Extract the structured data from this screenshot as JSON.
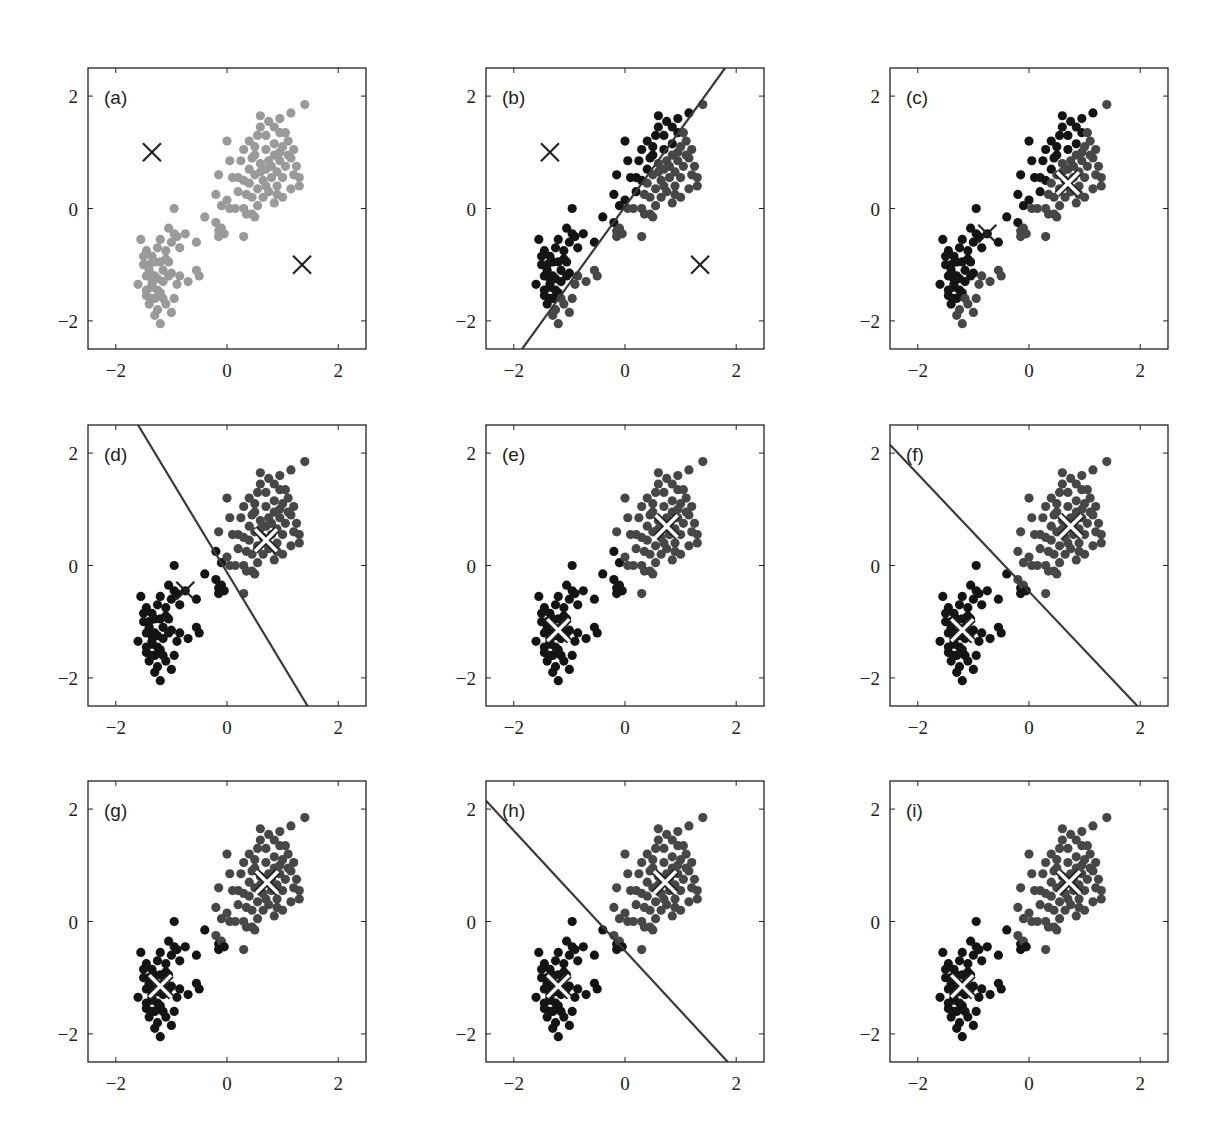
{
  "chart_data": {
    "type": "scatter",
    "xlim": [
      -2.5,
      2.5
    ],
    "ylim": [
      -2.5,
      2.5
    ],
    "xticks": [
      "−2",
      "0",
      "2"
    ],
    "yticks": [
      "2",
      "0",
      "−2"
    ],
    "grid": false,
    "legend": null,
    "colors": {
      "unassigned": "#9a9a9a",
      "cluster1": "#141414",
      "cluster2": "#474747",
      "line": "#3a3a3a",
      "axis": "#222222"
    },
    "panels": [
      {
        "label": "(a)",
        "state": "init",
        "centroids": [
          [
            -1.35,
            1.0
          ],
          [
            1.35,
            -1.0
          ]
        ],
        "centroid_style": "black",
        "line": null
      },
      {
        "label": "(b)",
        "state": "assign",
        "centroids": [
          [
            -1.35,
            1.0
          ],
          [
            1.35,
            -1.0
          ]
        ],
        "centroid_style": "black",
        "line": [
          [
            -1.85,
            -2.5
          ],
          [
            1.8,
            2.5
          ]
        ]
      },
      {
        "label": "(c)",
        "state": "update",
        "centroids": [
          [
            -0.75,
            -0.45
          ],
          [
            0.7,
            0.45
          ]
        ],
        "centroid_style": "mixed",
        "line": null
      },
      {
        "label": "(d)",
        "state": "assign",
        "centroids": [
          [
            -0.75,
            -0.45
          ],
          [
            0.7,
            0.45
          ]
        ],
        "centroid_style": "mixed",
        "line": [
          [
            -1.6,
            2.5
          ],
          [
            1.45,
            -2.5
          ]
        ]
      },
      {
        "label": "(e)",
        "state": "update",
        "centroids": [
          [
            -1.2,
            -1.15
          ],
          [
            0.75,
            0.7
          ]
        ],
        "centroid_style": "white",
        "line": null
      },
      {
        "label": "(f)",
        "state": "assign",
        "centroids": [
          [
            -1.2,
            -1.15
          ],
          [
            0.75,
            0.7
          ]
        ],
        "centroid_style": "white",
        "line": [
          [
            -2.5,
            2.15
          ],
          [
            1.95,
            -2.5
          ]
        ]
      },
      {
        "label": "(g)",
        "state": "update",
        "centroids": [
          [
            -1.2,
            -1.15
          ],
          [
            0.72,
            0.7
          ]
        ],
        "centroid_style": "white",
        "line": null
      },
      {
        "label": "(h)",
        "state": "assign",
        "centroids": [
          [
            -1.2,
            -1.15
          ],
          [
            0.72,
            0.7
          ]
        ],
        "centroid_style": "white",
        "line": [
          [
            -2.5,
            2.15
          ],
          [
            1.85,
            -2.5
          ]
        ]
      },
      {
        "label": "(i)",
        "state": "update",
        "centroids": [
          [
            -1.2,
            -1.15
          ],
          [
            0.72,
            0.7
          ]
        ],
        "centroid_style": "white",
        "line": null
      }
    ],
    "points": [
      [
        -1.55,
        -0.55
      ],
      [
        -1.45,
        -0.75
      ],
      [
        -1.5,
        -0.85
      ],
      [
        -1.6,
        -1.35
      ],
      [
        -1.45,
        -1.2
      ],
      [
        -1.4,
        -1.0
      ],
      [
        -1.35,
        -1.4
      ],
      [
        -1.3,
        -1.6
      ],
      [
        -1.25,
        -1.8
      ],
      [
        -1.2,
        -2.05
      ],
      [
        -1.3,
        -1.9
      ],
      [
        -1.4,
        -1.7
      ],
      [
        -1.45,
        -1.55
      ],
      [
        -1.35,
        -1.25
      ],
      [
        -1.3,
        -0.95
      ],
      [
        -1.25,
        -0.7
      ],
      [
        -1.2,
        -0.55
      ],
      [
        -1.1,
        -0.75
      ],
      [
        -1.05,
        -0.95
      ],
      [
        -1.0,
        -1.15
      ],
      [
        -1.15,
        -1.3
      ],
      [
        -1.2,
        -1.5
      ],
      [
        -1.1,
        -1.7
      ],
      [
        -1.0,
        -1.85
      ],
      [
        -0.95,
        -1.6
      ],
      [
        -0.9,
        -1.35
      ],
      [
        -0.85,
        -1.2
      ],
      [
        -1.0,
        -0.6
      ],
      [
        -0.95,
        -0.45
      ],
      [
        -0.9,
        -0.5
      ],
      [
        -0.85,
        -0.7
      ],
      [
        -1.05,
        -0.35
      ],
      [
        -0.75,
        -0.45
      ],
      [
        -0.7,
        -1.3
      ],
      [
        -0.55,
        -1.1
      ],
      [
        -0.5,
        -1.2
      ],
      [
        -1.5,
        -1.0
      ],
      [
        -1.4,
        -1.1
      ],
      [
        -1.35,
        -1.35
      ],
      [
        -1.25,
        -1.45
      ],
      [
        -1.15,
        -1.1
      ],
      [
        -1.05,
        -1.2
      ],
      [
        -1.3,
        -1.2
      ],
      [
        -1.2,
        -0.95
      ],
      [
        -1.1,
        -0.9
      ],
      [
        -1.45,
        -1.45
      ],
      [
        -1.35,
        -1.6
      ],
      [
        -1.15,
        -1.6
      ],
      [
        -1.25,
        -1.25
      ],
      [
        -1.35,
        -0.85
      ],
      [
        -0.95,
        0.0
      ],
      [
        -0.4,
        -0.15
      ],
      [
        -0.55,
        -0.6
      ],
      [
        -0.2,
        -0.25
      ],
      [
        -0.15,
        -0.4
      ],
      [
        -0.1,
        -0.35
      ],
      [
        -0.05,
        -0.45
      ],
      [
        -0.15,
        -0.5
      ],
      [
        0.3,
        -0.5
      ],
      [
        -0.1,
        0.05
      ],
      [
        -0.2,
        0.25
      ],
      [
        -0.15,
        0.6
      ],
      [
        0.0,
        1.2
      ],
      [
        0.05,
        0.85
      ],
      [
        0.1,
        0.55
      ],
      [
        0.0,
        0.15
      ],
      [
        0.05,
        0.0
      ],
      [
        0.15,
        0.0
      ],
      [
        0.3,
        0.0
      ],
      [
        0.35,
        -0.1
      ],
      [
        0.45,
        -0.1
      ],
      [
        0.5,
        -0.15
      ],
      [
        0.2,
        0.3
      ],
      [
        0.3,
        0.5
      ],
      [
        0.4,
        0.7
      ],
      [
        0.45,
        0.9
      ],
      [
        0.5,
        1.1
      ],
      [
        0.55,
        1.3
      ],
      [
        0.6,
        1.45
      ],
      [
        0.6,
        1.65
      ],
      [
        0.7,
        1.3
      ],
      [
        0.75,
        1.55
      ],
      [
        0.85,
        1.45
      ],
      [
        0.95,
        1.35
      ],
      [
        1.05,
        1.35
      ],
      [
        1.1,
        1.2
      ],
      [
        1.2,
        1.05
      ],
      [
        1.25,
        0.75
      ],
      [
        1.3,
        0.55
      ],
      [
        1.3,
        0.4
      ],
      [
        1.15,
        0.35
      ],
      [
        1.0,
        0.2
      ],
      [
        0.9,
        0.4
      ],
      [
        0.8,
        0.55
      ],
      [
        0.7,
        0.7
      ],
      [
        0.6,
        0.8
      ],
      [
        0.5,
        0.6
      ],
      [
        0.4,
        0.45
      ],
      [
        0.35,
        0.25
      ],
      [
        0.55,
        0.35
      ],
      [
        0.65,
        0.5
      ],
      [
        0.75,
        0.85
      ],
      [
        0.85,
        0.95
      ],
      [
        0.95,
        0.85
      ],
      [
        1.05,
        0.75
      ],
      [
        1.15,
        0.9
      ],
      [
        0.7,
        1.05
      ],
      [
        0.6,
        0.65
      ],
      [
        0.8,
        0.75
      ],
      [
        0.9,
        0.65
      ],
      [
        1.0,
        0.55
      ],
      [
        0.75,
        0.3
      ],
      [
        0.65,
        0.2
      ],
      [
        0.85,
        0.1
      ],
      [
        0.55,
        0.05
      ],
      [
        1.4,
        1.85
      ],
      [
        1.15,
        1.7
      ],
      [
        0.95,
        1.6
      ],
      [
        0.25,
        0.85
      ],
      [
        0.3,
        1.05
      ],
      [
        0.4,
        1.2
      ],
      [
        0.2,
        0.55
      ],
      [
        0.45,
        0.2
      ],
      [
        0.95,
        1.0
      ],
      [
        1.1,
        0.95
      ],
      [
        1.2,
        0.6
      ],
      [
        0.9,
        0.25
      ],
      [
        0.7,
        0.4
      ],
      [
        0.5,
        0.95
      ],
      [
        0.85,
        1.15
      ],
      [
        1.0,
        1.1
      ]
    ]
  },
  "panel_labels": [
    "(a)",
    "(b)",
    "(c)",
    "(d)",
    "(e)",
    "(f)",
    "(g)",
    "(h)",
    "(i)"
  ]
}
